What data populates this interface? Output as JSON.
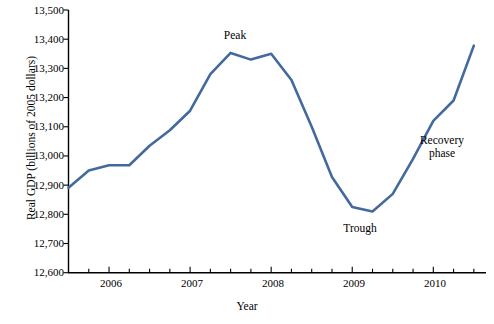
{
  "chart_data": {
    "type": "line",
    "title": "",
    "xlabel": "Year",
    "ylabel": "Real GDP (billions of 2005 dollars)",
    "ylim": [
      12600,
      13500
    ],
    "ytick_step": 100,
    "yticks": [
      "12,600",
      "12,700",
      "12,800",
      "12,900",
      "13,000",
      "13,100",
      "13,200",
      "13,300",
      "13,400",
      "13,500"
    ],
    "ytick_values": [
      12600,
      12700,
      12800,
      12900,
      13000,
      13100,
      13200,
      13300,
      13400,
      13500
    ],
    "xticks": [
      "2006",
      "2007",
      "2008",
      "2009",
      "2010"
    ],
    "xtick_values": [
      2006,
      2007,
      2008,
      2009,
      2010
    ],
    "xlim": [
      2005.5,
      2010.65
    ],
    "minor_ticks_per_interval": 4,
    "grid": false,
    "legend": false,
    "series": [
      {
        "name": "Real GDP",
        "color": "#43699E",
        "line_width": 2.6,
        "x": [
          2005.5,
          2005.75,
          2006.0,
          2006.25,
          2006.5,
          2006.75,
          2007.0,
          2007.25,
          2007.5,
          2007.75,
          2008.0,
          2008.25,
          2008.5,
          2008.75,
          2009.0,
          2009.25,
          2009.5,
          2009.75,
          2010.0,
          2010.25,
          2010.5
        ],
        "values": [
          12891,
          12950,
          12968,
          12968,
          13035,
          13088,
          13155,
          13280,
          13353,
          13330,
          13350,
          13260,
          13100,
          12928,
          12825,
          12810,
          12870,
          12990,
          13120,
          13190,
          13378
        ]
      }
    ],
    "annotations": [
      {
        "text": "Peak",
        "x": 2007.33,
        "y": 13420
      },
      {
        "text": "Trough",
        "x": 2008.92,
        "y": 12735
      },
      {
        "text": "Recovery\nphase",
        "x": 2010.02,
        "y": 13075
      }
    ]
  }
}
